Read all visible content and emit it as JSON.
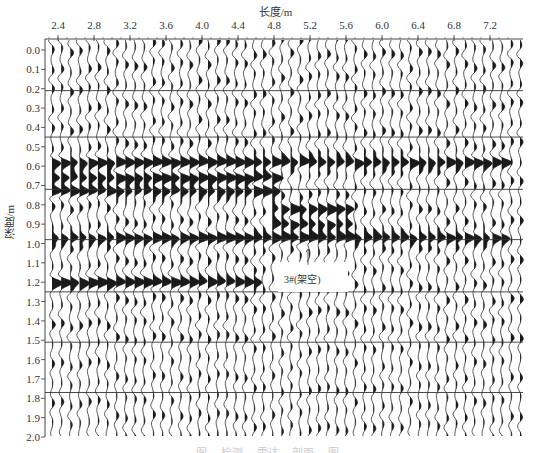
{
  "figure": {
    "x_axis_label": "长度/m",
    "y_axis_label": "深度/m",
    "annotation": "3#(架空)",
    "caption_partial": "图 ... 检测 ... 雷达 ... 剖面 ... 图",
    "colors": {
      "trace": "#1a1a1a",
      "grid": "#333333",
      "background": "#ffffff"
    }
  },
  "chart_data": {
    "type": "heatmap",
    "title": "",
    "subtitle": "GPR wiggle-trace radar profile (variable-area fill)",
    "xlabel": "长度/m",
    "ylabel": "深度/m",
    "x_ticks": [
      "2.4",
      "2.8",
      "3.2",
      "3.6",
      "4.0",
      "4.4",
      "4.8",
      "5.2",
      "5.6",
      "6.0",
      "6.4",
      "6.8",
      "7.2"
    ],
    "y_ticks": [
      "0.0",
      "0.1",
      "0.2",
      "0.3",
      "0.4",
      "0.5",
      "0.6",
      "0.7",
      "0.8",
      "0.9",
      "1.0",
      "1.1",
      "1.2",
      "1.3",
      "1.4",
      "1.5",
      "1.6",
      "1.7",
      "1.8",
      "1.9",
      "2.0"
    ],
    "xlim": [
      2.25,
      7.45
    ],
    "ylim": [
      0.0,
      2.0
    ],
    "y_inverted": true,
    "x_axis_position": "top",
    "grid": false,
    "horizontal_reference_lines_depth_m": [
      0.21,
      0.45,
      0.72,
      0.98,
      1.25,
      1.51,
      1.77
    ],
    "trace_count": 52,
    "strong_reflection_bands_depth_m": [
      {
        "depth": 0.58,
        "x_range": [
          2.3,
          7.4
        ]
      },
      {
        "depth": 0.66,
        "x_range": [
          2.3,
          4.8
        ]
      },
      {
        "depth": 0.73,
        "x_range": [
          2.3,
          4.8
        ]
      },
      {
        "depth": 0.82,
        "x_range": [
          4.7,
          5.6
        ]
      },
      {
        "depth": 0.9,
        "x_range": [
          4.7,
          5.6
        ]
      },
      {
        "depth": 0.97,
        "x_range": [
          2.3,
          7.4
        ]
      },
      {
        "depth": 1.2,
        "x_range": [
          2.3,
          4.6
        ]
      }
    ],
    "annotations": [
      {
        "text": "3#(架空)",
        "x": 5.2,
        "depth": 1.12,
        "arrow_to_depth": 1.03
      }
    ]
  }
}
